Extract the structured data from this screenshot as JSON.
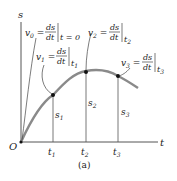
{
  "figure": {
    "caption": "(a)",
    "axes": {
      "vertical_label": "s",
      "horizontal_label": "t",
      "origin_label": "O"
    },
    "time_ticks": [
      "t1",
      "t2",
      "t3"
    ],
    "position_labels": [
      "s1",
      "s2",
      "s3"
    ],
    "annotations": [
      {
        "lhs": "v0 =",
        "frac_num": "ds",
        "frac_den": "dt",
        "eval": "t = 0"
      },
      {
        "lhs": "v1 =",
        "frac_num": "ds",
        "frac_den": "dt",
        "eval": "t1"
      },
      {
        "lhs": "v2 =",
        "frac_num": "ds",
        "frac_den": "dt",
        "eval": "t2"
      },
      {
        "lhs": "v3 =",
        "frac_num": "ds",
        "frac_den": "dt",
        "eval": "t3"
      }
    ],
    "colors": {
      "curve": "#8a8a8a",
      "axis": "#555555",
      "text": "#222222"
    }
  }
}
